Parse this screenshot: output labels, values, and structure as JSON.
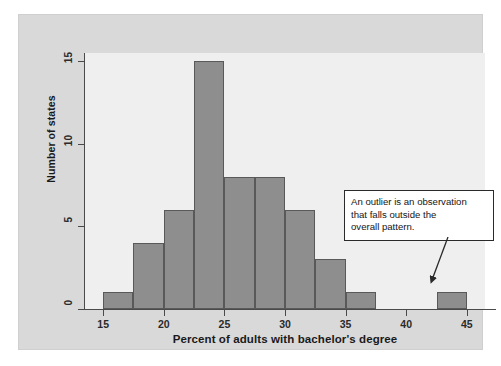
{
  "chart_data": {
    "type": "bar",
    "title": "",
    "subtitle": "",
    "xlabel": "Percent of adults with bachelor's degree",
    "ylabel": "Number of states",
    "xlim": [
      13.5,
      46.5
    ],
    "ylim": [
      0,
      15.5
    ],
    "grid": false,
    "legend": "none",
    "bin_width": 2.5,
    "bin_edges": [
      15,
      17.5,
      20,
      22.5,
      25,
      27.5,
      30,
      32.5,
      35,
      37.5,
      40,
      42.5,
      45
    ],
    "categories": [
      "15-17.5",
      "17.5-20",
      "20-22.5",
      "22.5-25",
      "25-27.5",
      "27.5-30",
      "30-32.5",
      "32.5-35",
      "35-37.5",
      "37.5-40",
      "40-42.5",
      "42.5-45"
    ],
    "values": [
      1,
      4,
      6,
      15,
      8,
      8,
      6,
      3,
      1,
      0,
      0,
      1
    ],
    "xticks": [
      15,
      20,
      25,
      30,
      35,
      40,
      45
    ],
    "xtick_labels": [
      "15",
      "20",
      "25",
      "30",
      "35",
      "40",
      "45"
    ],
    "yticks": [
      0,
      5,
      10,
      15
    ],
    "ytick_labels": [
      "0",
      "5",
      "10",
      "15"
    ],
    "bar_color": "#8e8e8e",
    "bar_edge_color": "#595959",
    "plot_background": "#efefef",
    "figure_background": "#d9d9d9",
    "annotations": [
      {
        "text": "An outlier is an observation that falls outside the overall pattern.",
        "points_to_bin": "42.5-45",
        "points_to_value": 1
      }
    ]
  },
  "annotation": {
    "line1": "An outlier is an observation",
    "line2": "that falls outside the",
    "line3": "overall pattern."
  }
}
